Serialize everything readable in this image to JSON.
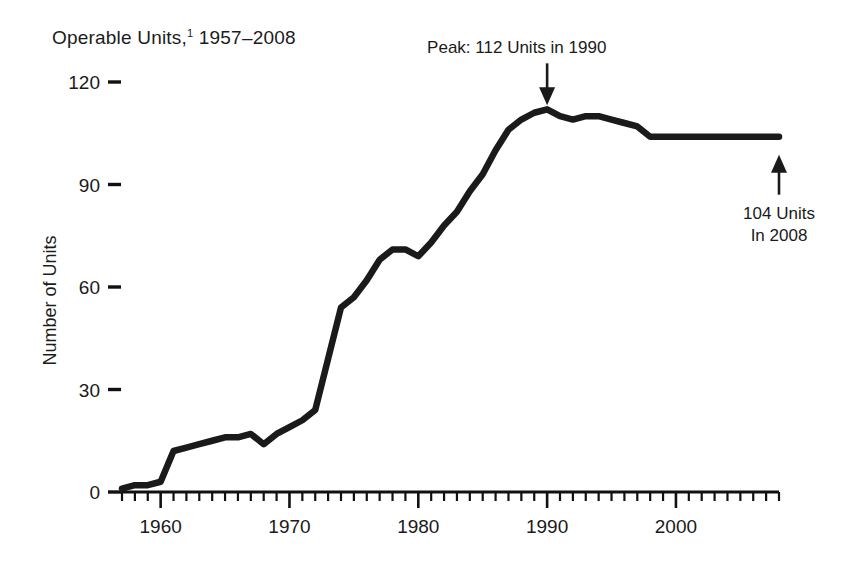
{
  "chart_data": {
    "type": "line",
    "title": "Operable Units,",
    "title_footnote_marker": "1",
    "title_range": " 1957–2008",
    "xlabel": "",
    "ylabel": "Number of Units",
    "xlim": [
      1957,
      2008
    ],
    "ylim": [
      0,
      120
    ],
    "ytick_labels": [
      "0",
      "30",
      "60",
      "90",
      "120"
    ],
    "ytick_values": [
      0,
      30,
      60,
      90,
      120
    ],
    "xtick_labels": [
      "1960",
      "1970",
      "1980",
      "1990",
      "2000"
    ],
    "xtick_values": [
      1960,
      1970,
      1980,
      1990,
      2000
    ],
    "minor_x_tick_interval": 1,
    "grid": false,
    "legend": false,
    "line_color": "#1a1a1a",
    "background_color": "#ffffff",
    "x": [
      1957,
      1958,
      1959,
      1960,
      1961,
      1962,
      1963,
      1964,
      1965,
      1966,
      1967,
      1968,
      1969,
      1970,
      1971,
      1972,
      1973,
      1974,
      1975,
      1976,
      1977,
      1978,
      1979,
      1980,
      1981,
      1982,
      1983,
      1984,
      1985,
      1986,
      1987,
      1988,
      1989,
      1990,
      1991,
      1992,
      1993,
      1994,
      1995,
      1996,
      1997,
      1998,
      1999,
      2000,
      2001,
      2002,
      2003,
      2004,
      2005,
      2006,
      2007,
      2008
    ],
    "values": [
      1,
      2,
      2,
      3,
      12,
      13,
      14,
      15,
      16,
      16,
      17,
      14,
      17,
      19,
      21,
      24,
      39,
      54,
      57,
      62,
      68,
      71,
      71,
      69,
      73,
      78,
      82,
      88,
      93,
      100,
      106,
      109,
      111,
      112,
      110,
      109,
      110,
      110,
      109,
      108,
      107,
      104,
      104,
      104,
      104,
      104,
      104,
      104,
      104,
      104,
      104,
      104
    ],
    "annotations": [
      {
        "id": "peak-annotation",
        "text": "Peak:  112 Units in 1990",
        "value": 112,
        "year": 1990,
        "arrow": "down"
      },
      {
        "id": "end-annotation",
        "text_line1": "104 Units",
        "text_line2": "In 2008",
        "value": 104,
        "year": 2008,
        "arrow": "up"
      }
    ]
  }
}
